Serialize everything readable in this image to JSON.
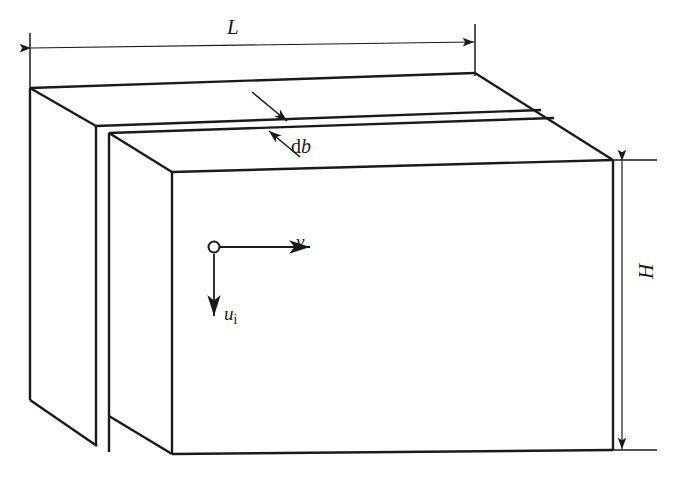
{
  "figure": {
    "type": "engineering-schematic",
    "background_color": "#ffffff",
    "stroke_color": "#1a1a1a",
    "width": 677,
    "height": 485
  },
  "labels": {
    "length": "L",
    "height": "H",
    "thickness_d": "d",
    "thickness_b": "b",
    "velocity_horizontal": "v",
    "velocity_vertical": "u",
    "velocity_vertical_subscript": "i"
  },
  "dimensions": {
    "length_line": {
      "name": "L",
      "orientation": "horizontal",
      "x_start": 30,
      "x_end": 475,
      "y": 48,
      "arrowheads": "both"
    },
    "height_line": {
      "name": "H",
      "orientation": "vertical",
      "y_start": 160,
      "y_end": 450,
      "x": 622,
      "arrowheads": "both"
    }
  },
  "annotations": {
    "db_leader_upper": {
      "from": [
        253,
        93
      ],
      "to": [
        286,
        120
      ]
    },
    "db_leader_lower": {
      "from": [
        298,
        156
      ],
      "to": [
        268,
        130
      ]
    },
    "velocity_origin": [
      214,
      247
    ],
    "v_arrow": {
      "from": [
        222,
        247
      ],
      "to": [
        312,
        247
      ]
    },
    "u_arrow": {
      "from": [
        214,
        255
      ],
      "to": [
        214,
        318
      ]
    }
  },
  "caption": {
    "text": "",
    "visible": false
  }
}
